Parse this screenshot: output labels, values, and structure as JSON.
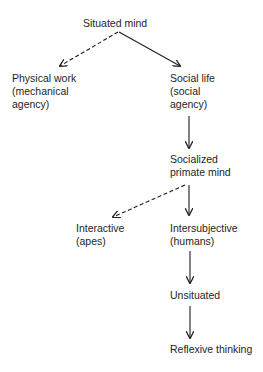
{
  "diagram": {
    "type": "flow-tree",
    "nodes": {
      "situated_mind": {
        "lines": [
          "Situated mind"
        ]
      },
      "physical_work": {
        "lines": [
          "Physical work",
          "(mechanical",
          "agency)"
        ]
      },
      "social_life": {
        "lines": [
          "Social life",
          "(social",
          "agency)"
        ]
      },
      "socialized_primate_mind": {
        "lines": [
          "Socialized",
          "primate mind"
        ]
      },
      "interactive": {
        "lines": [
          "Interactive",
          "(apes)"
        ]
      },
      "intersubjective": {
        "lines": [
          "Intersubjective",
          "(humans)"
        ]
      },
      "unsituated": {
        "lines": [
          "Unsituated"
        ]
      },
      "reflexive_thinking": {
        "lines": [
          "Reflexive thinking"
        ]
      }
    },
    "edges": [
      {
        "from": "situated_mind",
        "to": "physical_work",
        "style": "dashed"
      },
      {
        "from": "situated_mind",
        "to": "social_life",
        "style": "solid"
      },
      {
        "from": "social_life",
        "to": "socialized_primate_mind",
        "style": "solid"
      },
      {
        "from": "socialized_primate_mind",
        "to": "interactive",
        "style": "dashed"
      },
      {
        "from": "socialized_primate_mind",
        "to": "intersubjective",
        "style": "solid"
      },
      {
        "from": "intersubjective",
        "to": "unsituated",
        "style": "solid"
      },
      {
        "from": "unsituated",
        "to": "reflexive_thinking",
        "style": "solid"
      }
    ],
    "colors": {
      "ink": "#1e1e1e",
      "background": "#ffffff"
    }
  }
}
